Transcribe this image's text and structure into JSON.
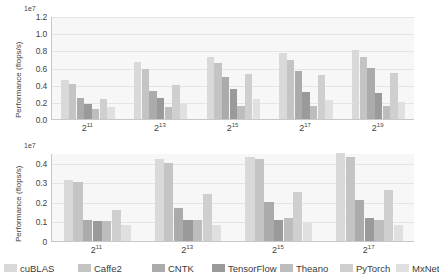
{
  "figure": {
    "width": 425,
    "height": 278
  },
  "legend": {
    "position": "bottom",
    "items": [
      {
        "label": "cuBLAS",
        "color": "#d9d9d9"
      },
      {
        "label": "Caffe2",
        "color": "#c4c4c4"
      },
      {
        "label": "CNTK",
        "color": "#ababab"
      },
      {
        "label": "TensorFlow",
        "color": "#9a9a9a"
      },
      {
        "label": "Theano",
        "color": "#bdbdbd"
      },
      {
        "label": "PyTorch",
        "color": "#cfcfcf"
      },
      {
        "label": "MxNet",
        "color": "#e0e0e0"
      }
    ]
  },
  "chart_data": [
    {
      "id": "top",
      "type": "bar",
      "title": "",
      "xlabel": "",
      "ylabel": "Performance (flops/s)",
      "offset_text": "1e7",
      "categories": [
        "2^11",
        "2^13",
        "2^15",
        "2^17",
        "2^19"
      ],
      "category_labels": [
        {
          "base": "2",
          "exp": "11"
        },
        {
          "base": "2",
          "exp": "13"
        },
        {
          "base": "2",
          "exp": "15"
        },
        {
          "base": "2",
          "exp": "17"
        },
        {
          "base": "2",
          "exp": "19"
        }
      ],
      "ylim": [
        0.0,
        1.2
      ],
      "yticks": [
        "0.0",
        "0.2",
        "0.4",
        "0.6",
        "0.8",
        "1.0",
        "1.2"
      ],
      "ytick_values": [
        0.0,
        0.2,
        0.4,
        0.6,
        0.8,
        1.0,
        1.2
      ],
      "grid": true,
      "series": [
        {
          "name": "cuBLAS",
          "values": [
            0.46,
            0.67,
            0.72,
            0.77,
            0.8
          ]
        },
        {
          "name": "Caffe2",
          "values": [
            0.41,
            0.58,
            0.65,
            0.69,
            0.72
          ]
        },
        {
          "name": "CNTK",
          "values": [
            0.24,
            0.33,
            0.49,
            0.56,
            0.59
          ]
        },
        {
          "name": "TensorFlow",
          "values": [
            0.17,
            0.24,
            0.35,
            0.32,
            0.3
          ]
        },
        {
          "name": "Theano",
          "values": [
            0.12,
            0.14,
            0.15,
            0.15,
            0.15
          ]
        },
        {
          "name": "PyTorch",
          "values": [
            0.23,
            0.4,
            0.53,
            0.51,
            0.54
          ]
        },
        {
          "name": "MxNet",
          "values": [
            0.14,
            0.17,
            0.23,
            0.22,
            0.2
          ]
        }
      ]
    },
    {
      "id": "bottom",
      "type": "bar",
      "title": "",
      "xlabel": "",
      "ylabel": "Performance (flops/s)",
      "offset_text": "1e7",
      "categories": [
        "2^11",
        "2^13",
        "2^15",
        "2^17"
      ],
      "category_labels": [
        {
          "base": "2",
          "exp": "11"
        },
        {
          "base": "2",
          "exp": "13"
        },
        {
          "base": "2",
          "exp": "15"
        },
        {
          "base": "2",
          "exp": "17"
        }
      ],
      "ylim": [
        0.0,
        0.45
      ],
      "yticks": [
        "0",
        "0.1",
        "0.2",
        "0.3",
        "0.4"
      ],
      "ytick_values": [
        0.0,
        0.1,
        0.2,
        0.3,
        0.4
      ],
      "grid": true,
      "series": [
        {
          "name": "cuBLAS",
          "values": [
            0.31,
            0.42,
            0.43,
            0.45
          ]
        },
        {
          "name": "Caffe2",
          "values": [
            0.3,
            0.4,
            0.42,
            0.43
          ]
        },
        {
          "name": "CNTK",
          "values": [
            0.11,
            0.17,
            0.2,
            0.21
          ]
        },
        {
          "name": "TensorFlow",
          "values": [
            0.1,
            0.11,
            0.11,
            0.12
          ]
        },
        {
          "name": "Theano",
          "values": [
            0.1,
            0.11,
            0.12,
            0.11
          ]
        },
        {
          "name": "PyTorch",
          "values": [
            0.16,
            0.24,
            0.25,
            0.26
          ]
        },
        {
          "name": "MxNet",
          "values": [
            0.08,
            0.08,
            0.09,
            0.08
          ]
        }
      ]
    }
  ]
}
